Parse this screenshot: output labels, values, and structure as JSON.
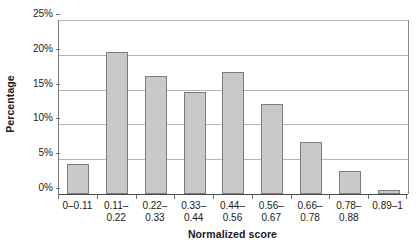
{
  "chart_data": {
    "type": "bar",
    "title": "",
    "xlabel": "Normalized score",
    "ylabel": "Percentage",
    "categories": [
      "0–0.11",
      "0.11–\n0.22",
      "0.22–\n0.33",
      "0.33–\n0.44",
      "0.44–\n0.56",
      "0.56–\n0.67",
      "0.66–\n0.78",
      "0.78–\n0.88",
      "0.89–1"
    ],
    "values": [
      4.3,
      20.4,
      17.0,
      14.6,
      17.5,
      13.0,
      7.5,
      3.3,
      0.6
    ],
    "ylim": [
      0,
      25
    ],
    "yticks": [
      0,
      5,
      10,
      15,
      20,
      25
    ],
    "ytick_labels": [
      "0%",
      "5%",
      "10%",
      "15%",
      "20%",
      "25%"
    ],
    "grid": true,
    "legend": false,
    "legend_position": "none",
    "bar_color": "#c9c9c9",
    "bar_border_color": "#7d7d7d",
    "gridline_color": "#b4b4b4",
    "axis_color": "#4a4a4a"
  }
}
